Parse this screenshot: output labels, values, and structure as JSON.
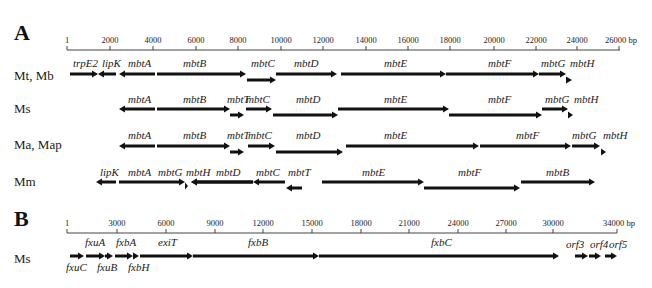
{
  "panels": [
    {
      "label": "A",
      "label_pos": [
        14,
        40
      ],
      "axis": {
        "y": 50,
        "x_start": 67,
        "x_end": 620,
        "unit": "bp",
        "ticks": [
          {
            "label": "1",
            "x": 67
          },
          {
            "label": "2000",
            "x": 110
          },
          {
            "label": "4000",
            "x": 153
          },
          {
            "label": "6000",
            "x": 196
          },
          {
            "label": "8000",
            "x": 238
          },
          {
            "label": "10000",
            "x": 281
          },
          {
            "label": "12000",
            "x": 323
          },
          {
            "label": "14000",
            "x": 366
          },
          {
            "label": "16000",
            "x": 408
          },
          {
            "label": "18000",
            "x": 450
          },
          {
            "label": "20000",
            "x": 494
          },
          {
            "label": "22000",
            "x": 536
          },
          {
            "label": "24000",
            "x": 577
          },
          {
            "label": "26000",
            "x": 619
          }
        ],
        "end_label": "26000 bp"
      },
      "rows": [
        {
          "label": "Mt, Mb",
          "y_label": 76,
          "genes": [
            {
              "name": "trpE2",
              "x1": 70,
              "x2": 98,
              "y": 74,
              "dir": "right",
              "lx": 73,
              "ly": 67
            },
            {
              "name": "lipK",
              "x1": 98,
              "x2": 116,
              "y": 74,
              "dir": "left",
              "lx": 102,
              "ly": 67
            },
            {
              "name": "mbtA",
              "x1": 119,
              "x2": 155,
              "y": 74,
              "dir": "left",
              "lx": 128,
              "ly": 67
            },
            {
              "name": "mbtB",
              "x1": 157,
              "x2": 246,
              "y": 74,
              "dir": "right",
              "lx": 183,
              "ly": 67
            },
            {
              "name": "mbtC",
              "x1": 247,
              "x2": 276,
              "y": 80,
              "dir": "right",
              "lx": 251,
              "ly": 67
            },
            {
              "name": "mbtD",
              "x1": 276,
              "x2": 337,
              "y": 74,
              "dir": "right",
              "lx": 294,
              "ly": 67
            },
            {
              "name": "mbtE",
              "x1": 341,
              "x2": 446,
              "y": 74,
              "dir": "right",
              "lx": 384,
              "ly": 67
            },
            {
              "name": "mbtF",
              "x1": 446,
              "x2": 539,
              "y": 74,
              "dir": "right",
              "lx": 488,
              "ly": 67
            },
            {
              "name": "mbtG",
              "x1": 539,
              "x2": 566,
              "y": 74,
              "dir": "right",
              "lx": 541,
              "ly": 67
            },
            {
              "name": "mbtH",
              "x1": 566,
              "x2": 572,
              "y": 80,
              "dir": "right",
              "lx": 570,
              "ly": 67
            }
          ]
        },
        {
          "label": "Ms",
          "y_label": 109,
          "genes": [
            {
              "name": "mbtA",
              "x1": 119,
              "x2": 155,
              "y": 109,
              "dir": "left",
              "lx": 128,
              "ly": 103
            },
            {
              "name": "mbtB",
              "x1": 157,
              "x2": 230,
              "y": 109,
              "dir": "right",
              "lx": 183,
              "ly": 103
            },
            {
              "name": "mbtT",
              "x1": 230,
              "x2": 244,
              "y": 115,
              "dir": "right",
              "lx": 227,
              "ly": 103
            },
            {
              "name": "mbtC",
              "x1": 246,
              "x2": 272,
              "y": 109,
              "dir": "right",
              "lx": 246,
              "ly": 103
            },
            {
              "name": "mbtD",
              "x1": 273,
              "x2": 338,
              "y": 115,
              "dir": "right",
              "lx": 296,
              "ly": 103
            },
            {
              "name": "mbtE",
              "x1": 338,
              "x2": 449,
              "y": 109,
              "dir": "right",
              "lx": 384,
              "ly": 103
            },
            {
              "name": "mbtF",
              "x1": 449,
              "x2": 542,
              "y": 115,
              "dir": "right",
              "lx": 488,
              "ly": 103
            },
            {
              "name": "mbtG",
              "x1": 542,
              "x2": 568,
              "y": 109,
              "dir": "right",
              "lx": 545,
              "ly": 103
            },
            {
              "name": "mbtH",
              "x1": 568,
              "x2": 573,
              "y": 115,
              "dir": "right",
              "lx": 574,
              "ly": 103
            }
          ]
        },
        {
          "label": "Ma, Map",
          "y_label": 145,
          "genes": [
            {
              "name": "mbtA",
              "x1": 119,
              "x2": 155,
              "y": 146,
              "dir": "left",
              "lx": 128,
              "ly": 139
            },
            {
              "name": "mbtB",
              "x1": 157,
              "x2": 230,
              "y": 146,
              "dir": "right",
              "lx": 183,
              "ly": 139
            },
            {
              "name": "mbtT",
              "x1": 230,
              "x2": 244,
              "y": 152,
              "dir": "right",
              "lx": 227,
              "ly": 139
            },
            {
              "name": "mbtC",
              "x1": 248,
              "x2": 275,
              "y": 146,
              "dir": "right",
              "lx": 248,
              "ly": 139
            },
            {
              "name": "mbtD",
              "x1": 276,
              "x2": 343,
              "y": 152,
              "dir": "right",
              "lx": 296,
              "ly": 139
            },
            {
              "name": "mbtE",
              "x1": 346,
              "x2": 479,
              "y": 146,
              "dir": "right",
              "lx": 384,
              "ly": 139
            },
            {
              "name": "mbtF",
              "x1": 480,
              "x2": 571,
              "y": 146,
              "dir": "right",
              "lx": 516,
              "ly": 139
            },
            {
              "name": "mbtG",
              "x1": 572,
              "x2": 600,
              "y": 146,
              "dir": "right",
              "lx": 572,
              "ly": 139
            },
            {
              "name": "mbtH",
              "x1": 601,
              "x2": 606,
              "y": 152,
              "dir": "right",
              "lx": 603,
              "ly": 139
            }
          ]
        },
        {
          "label": "Mm",
          "y_label": 182,
          "genes": [
            {
              "name": "lipK",
              "x1": 96,
              "x2": 116,
              "y": 182,
              "dir": "left",
              "lx": 100,
              "ly": 176
            },
            {
              "name": "mbtA",
              "x1": 119,
              "x2": 185,
              "y": 182,
              "dir": "right",
              "lx": 128,
              "ly": 176
            },
            {
              "name": "mbtG",
              "x1": 185,
              "x2": 188,
              "y": 186,
              "dir": "right",
              "lx": 158,
              "ly": 176
            },
            {
              "name": "mbtH",
              "x1": 191,
              "x2": 253,
              "y": 182,
              "dir": "left",
              "lx": 186,
              "ly": 176
            },
            {
              "name": "mbtD",
              "x1": 191,
              "x2": 253,
              "y": 182,
              "dir": "left",
              "lx": 216,
              "ly": 176
            },
            {
              "name": "mbtC",
              "x1": 253,
              "x2": 285,
              "y": 182,
              "dir": "left",
              "lx": 256,
              "ly": 176
            },
            {
              "name": "mbtT",
              "x1": 286,
              "x2": 302,
              "y": 188,
              "dir": "left",
              "lx": 288,
              "ly": 176
            },
            {
              "name": "mbtE",
              "x1": 322,
              "x2": 424,
              "y": 182,
              "dir": "right",
              "lx": 362,
              "ly": 176
            },
            {
              "name": "mbtF",
              "x1": 424,
              "x2": 520,
              "y": 188,
              "dir": "right",
              "lx": 458,
              "ly": 176
            },
            {
              "name": "mbtB",
              "x1": 521,
              "x2": 595,
              "y": 182,
              "dir": "right",
              "lx": 546,
              "ly": 176
            }
          ]
        }
      ]
    },
    {
      "label": "B",
      "label_pos": [
        14,
        226
      ],
      "axis": {
        "y": 233,
        "x_start": 67,
        "x_end": 617,
        "unit": "bp",
        "ticks": [
          {
            "label": "1",
            "x": 67
          },
          {
            "label": "3000",
            "x": 117
          },
          {
            "label": "6000",
            "x": 166
          },
          {
            "label": "9000",
            "x": 215
          },
          {
            "label": "12000",
            "x": 263
          },
          {
            "label": "15000",
            "x": 312
          },
          {
            "label": "18000",
            "x": 361
          },
          {
            "label": "21000",
            "x": 409
          },
          {
            "label": "24000",
            "x": 458
          },
          {
            "label": "27000",
            "x": 506
          },
          {
            "label": "30000",
            "x": 553
          },
          {
            "label": "34000",
            "x": 617
          }
        ],
        "end_label": "34000 bp"
      },
      "rows": [
        {
          "label": "Ms",
          "y_label": 259,
          "genes": [
            {
              "name": "fxuC",
              "x1": 70,
              "x2": 84,
              "y": 256,
              "dir": "right",
              "lx": 66,
              "ly": 271,
              "below": true
            },
            {
              "name": "fxuA",
              "x1": 86,
              "x2": 105,
              "y": 256,
              "dir": "right",
              "lx": 85,
              "ly": 246
            },
            {
              "name": "fxuB",
              "x1": 105,
              "x2": 113,
              "y": 256,
              "dir": "right",
              "lx": 97,
              "ly": 271,
              "below": true
            },
            {
              "name": "fxbA",
              "x1": 115,
              "x2": 133,
              "y": 256,
              "dir": "right",
              "lx": 116,
              "ly": 246
            },
            {
              "name": "fxbH",
              "x1": 133,
              "x2": 139,
              "y": 256,
              "dir": "right",
              "lx": 128,
              "ly": 271,
              "below": true
            },
            {
              "name": "exiT",
              "x1": 140,
              "x2": 193,
              "y": 256,
              "dir": "right",
              "lx": 158,
              "ly": 246
            },
            {
              "name": "fxbB",
              "x1": 193,
              "x2": 319,
              "y": 256,
              "dir": "right",
              "lx": 248,
              "ly": 246
            },
            {
              "name": "fxbC",
              "x1": 319,
              "x2": 559,
              "y": 256,
              "dir": "right",
              "lx": 431,
              "ly": 246
            },
            {
              "name": "orf3",
              "x1": 575,
              "x2": 588,
              "y": 256,
              "dir": "right",
              "lx": 566,
              "ly": 248
            },
            {
              "name": "orf4",
              "x1": 589,
              "x2": 601,
              "y": 256,
              "dir": "right",
              "lx": 590,
              "ly": 248
            },
            {
              "name": "orf5",
              "x1": 605,
              "x2": 617,
              "y": 256,
              "dir": "right",
              "lx": 609,
              "ly": 248
            }
          ]
        }
      ]
    }
  ],
  "colors": {
    "ink": "#111111",
    "axis": "#444444",
    "background": "#ffffff"
  }
}
